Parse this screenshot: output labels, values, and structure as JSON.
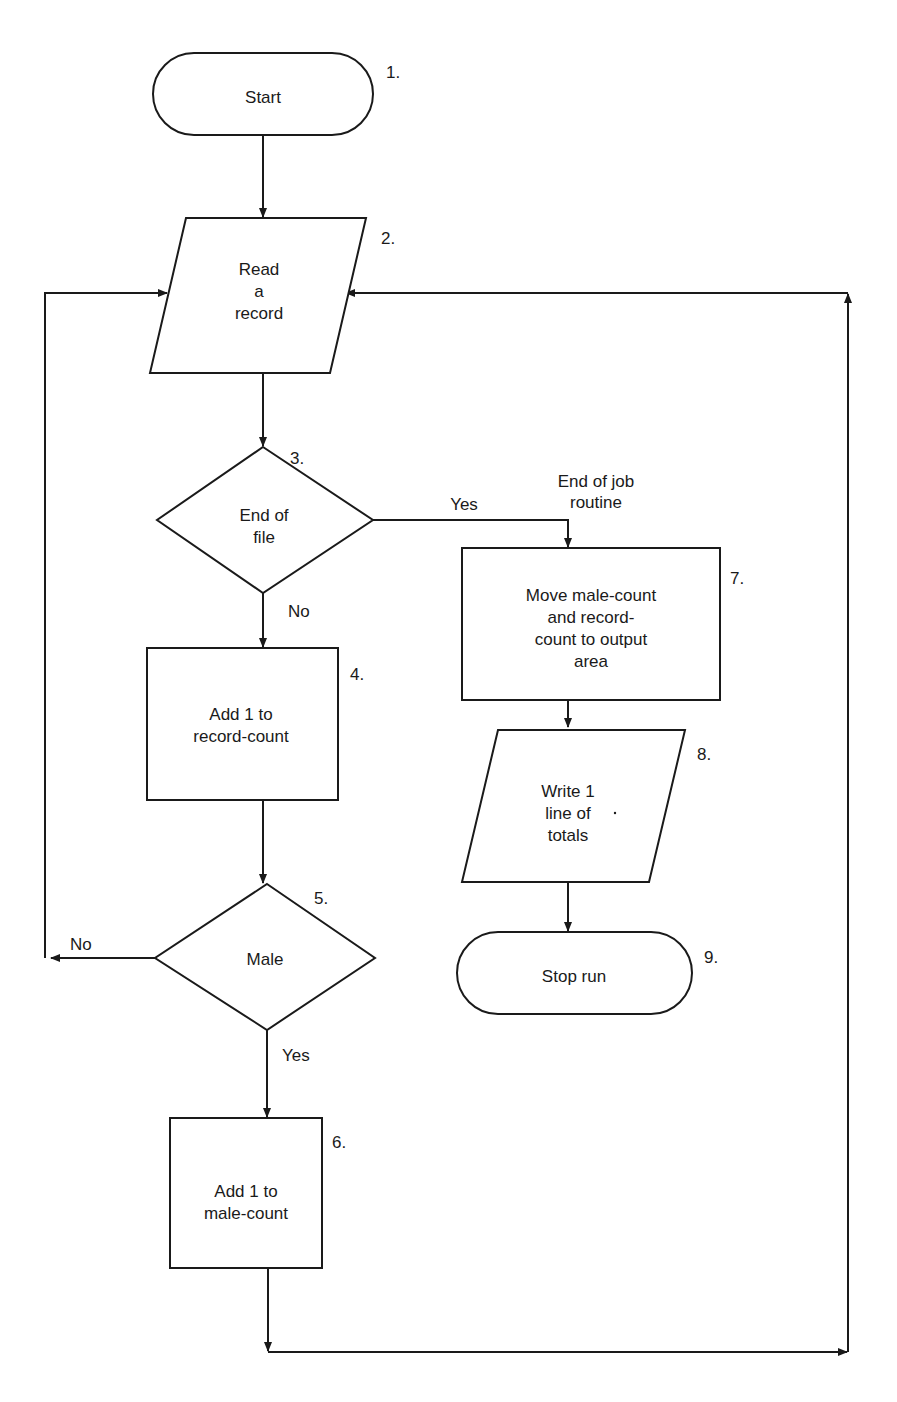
{
  "diagram": {
    "type": "flowchart",
    "nodes": [
      {
        "id": "1",
        "number": "1.",
        "shape": "terminal",
        "lines": [
          "Start"
        ]
      },
      {
        "id": "2",
        "number": "2.",
        "shape": "input-output",
        "lines": [
          "Read",
          "a",
          "record"
        ]
      },
      {
        "id": "3",
        "number": "3.",
        "shape": "decision",
        "lines": [
          "End of",
          "file"
        ]
      },
      {
        "id": "4",
        "number": "4.",
        "shape": "process",
        "lines": [
          "Add 1 to",
          "record-count"
        ]
      },
      {
        "id": "5",
        "number": "5.",
        "shape": "decision",
        "lines": [
          "Male"
        ]
      },
      {
        "id": "6",
        "number": "6.",
        "shape": "process",
        "lines": [
          "Add 1 to",
          "male-count"
        ]
      },
      {
        "id": "7",
        "number": "7.",
        "shape": "process",
        "lines": [
          "Move male-count",
          "and record-",
          "count to output",
          "area"
        ]
      },
      {
        "id": "8",
        "number": "8.",
        "shape": "input-output",
        "lines": [
          "Write 1",
          "line of",
          "totals"
        ]
      },
      {
        "id": "9",
        "number": "9.",
        "shape": "terminal",
        "lines": [
          "Stop run"
        ]
      }
    ],
    "edges": [
      {
        "from": "1",
        "to": "2",
        "label": ""
      },
      {
        "from": "2",
        "to": "3",
        "label": ""
      },
      {
        "from": "3",
        "to": "7",
        "label": "Yes"
      },
      {
        "from": "3",
        "to": "4",
        "label": "No"
      },
      {
        "from": "4",
        "to": "5",
        "label": ""
      },
      {
        "from": "5",
        "to": "2",
        "label": "No"
      },
      {
        "from": "5",
        "to": "6",
        "label": "Yes"
      },
      {
        "from": "6",
        "to": "2",
        "label": ""
      },
      {
        "from": "7",
        "to": "8",
        "label": ""
      },
      {
        "from": "8",
        "to": "9",
        "label": ""
      }
    ],
    "annotations": {
      "end_of_job": [
        "End of job",
        "routine"
      ]
    },
    "edge_labels": {
      "yes_3": "Yes",
      "no_3": "No",
      "no_5": "No",
      "yes_5": "Yes"
    }
  }
}
